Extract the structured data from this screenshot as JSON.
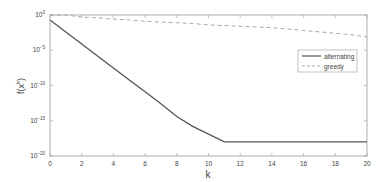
{
  "chart_data": {
    "type": "line",
    "title": "",
    "xlabel": "k",
    "ylabel": "f(x^k)",
    "yscale": "log",
    "xlim": [
      0,
      20
    ],
    "ylim_exponent": [
      -20,
      0
    ],
    "x_ticks": [
      0,
      2,
      4,
      6,
      8,
      10,
      12,
      14,
      16,
      18,
      20
    ],
    "y_ticks_exponent": [
      0,
      -5,
      -10,
      -15,
      -20
    ],
    "y_tick_labels": [
      "10^0",
      "10^-5",
      "10^-10",
      "10^-15",
      "10^-20"
    ],
    "grid": false,
    "legend_position": "right-upper",
    "series": [
      {
        "name": "alternating",
        "style": "solid",
        "color": "#555555",
        "x": [
          0,
          1,
          2,
          3,
          4,
          5,
          6,
          7,
          8,
          9,
          10,
          11,
          12,
          13,
          14,
          15,
          16,
          17,
          18,
          19,
          20
        ],
        "log10_y": [
          -0.7,
          -2.4,
          -4.1,
          -5.8,
          -7.5,
          -9.2,
          -10.9,
          -12.6,
          -14.4,
          -15.8,
          -16.9,
          -18.0,
          -18.0,
          -18.0,
          -18.0,
          -18.0,
          -18.0,
          -18.0,
          -18.0,
          -18.0,
          -18.0
        ]
      },
      {
        "name": "greedy",
        "style": "dashed",
        "color": "#aaaaaa",
        "x": [
          0,
          1,
          2,
          3,
          4,
          5,
          6,
          7,
          8,
          9,
          10,
          11,
          12,
          13,
          14,
          15,
          16,
          17,
          18,
          19,
          20
        ],
        "log10_y": [
          0.0,
          0.0,
          -0.3,
          -0.4,
          -0.6,
          -0.7,
          -0.9,
          -1.0,
          -1.1,
          -1.2,
          -1.4,
          -1.5,
          -1.6,
          -1.7,
          -1.8,
          -2.0,
          -2.2,
          -2.4,
          -2.6,
          -2.8,
          -3.1
        ]
      }
    ]
  },
  "axes": {
    "xlabel": "k",
    "ylabel_base": "f(x",
    "ylabel_sup": "k",
    "ylabel_end": ")"
  },
  "legend": {
    "items": [
      {
        "label": "alternating"
      },
      {
        "label": "greedy"
      }
    ]
  }
}
